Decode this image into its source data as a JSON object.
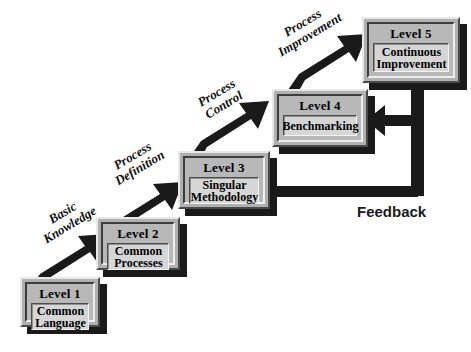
{
  "diagram": {
    "type": "staircase-maturity-model",
    "colors": {
      "arrow": "#1a1a1a",
      "box_frame": "#b0b0b0",
      "box_panel": "#d6d6d6",
      "text": "#000000",
      "feedback_text": "#1a1a1a",
      "background": "#ffffff"
    }
  },
  "levels": [
    {
      "id": "level-1",
      "title": "Level 1",
      "desc": "Common\nLanguage"
    },
    {
      "id": "level-2",
      "title": "Level 2",
      "desc": "Common\nProcesses"
    },
    {
      "id": "level-3",
      "title": "Level 3",
      "desc": "Singular\nMethodology"
    },
    {
      "id": "level-4",
      "title": "Level 4",
      "desc": "Benchmarking"
    },
    {
      "id": "level-5",
      "title": "Level 5",
      "desc": "Continuous\nImprovement"
    }
  ],
  "transitions": [
    {
      "id": "basic-knowledge",
      "label": "Basic\nKnowledge",
      "from": "level-1",
      "to": "level-2"
    },
    {
      "id": "process-definition",
      "label": "Process\nDefinition",
      "from": "level-2",
      "to": "level-3"
    },
    {
      "id": "process-control",
      "label": "Process\nControl",
      "from": "level-3",
      "to": "level-4"
    },
    {
      "id": "process-improvement",
      "label": "Process\nImprovement",
      "from": "level-4",
      "to": "level-5"
    }
  ],
  "feedback": {
    "label": "Feedback",
    "from": "level-5",
    "to": [
      "level-4",
      "level-3"
    ]
  }
}
